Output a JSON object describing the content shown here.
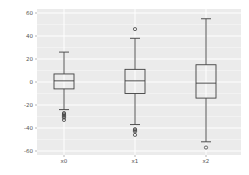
{
  "chart_data": {
    "type": "box",
    "title": "",
    "xlabel": "",
    "ylabel": "",
    "categories": [
      "x0",
      "x1",
      "x2"
    ],
    "ylim": [
      -62,
      62
    ],
    "yticks": [
      -60,
      -40,
      -20,
      0,
      20,
      40,
      60
    ],
    "grid": true,
    "legend": null,
    "series": [
      {
        "name": "x0",
        "whisker_low": -24,
        "q1": -6,
        "median": 1,
        "q3": 7,
        "whisker_high": 26,
        "outliers": [
          -27,
          -28,
          -29,
          -30,
          -31,
          -33
        ]
      },
      {
        "name": "x1",
        "whisker_low": -37,
        "q1": -10,
        "median": 1,
        "q3": 11,
        "whisker_high": 38,
        "outliers": [
          46,
          -41,
          -42,
          -43,
          -46
        ]
      },
      {
        "name": "x2",
        "whisker_low": -52,
        "q1": -14,
        "median": -1,
        "q3": 15,
        "whisker_high": 55,
        "outliers": [
          -57
        ]
      }
    ]
  },
  "colors": {
    "panel_background": "#ebebeb",
    "grid": "#ffffff",
    "box_line": "#404040",
    "tick_label": "#555555"
  }
}
